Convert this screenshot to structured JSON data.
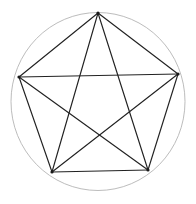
{
  "figure": {
    "canvas": {
      "width": 196,
      "height": 204,
      "background": "#ffffff"
    },
    "circle": {
      "name": "circumscribed-circle",
      "cx": 98,
      "cy": 101.5,
      "rx": 87,
      "ry": 89,
      "stroke": "#b4b4b4",
      "stroke_width": 0.9
    },
    "vertices": [
      {
        "id": "top",
        "label": "A",
        "x": 98,
        "y": 13
      },
      {
        "id": "right",
        "label": "B",
        "x": 178,
        "y": 74
      },
      {
        "id": "bottom-right",
        "label": "C",
        "x": 148,
        "y": 170
      },
      {
        "id": "bottom-left",
        "label": "D",
        "x": 52,
        "y": 172
      },
      {
        "id": "left",
        "label": "E",
        "x": 19,
        "y": 77
      }
    ],
    "vertex_style": {
      "fill": "#1a1a1a",
      "radius": 1.6
    },
    "edge_style": {
      "stroke": "#222222",
      "stroke_width": 1.15
    },
    "edges": [
      {
        "id": "edge-top-right",
        "kind": "pentagon-side",
        "from": "top",
        "to": "right"
      },
      {
        "id": "edge-right-bottomright",
        "kind": "pentagon-side",
        "from": "right",
        "to": "bottom-right"
      },
      {
        "id": "edge-bottomright-bottomleft",
        "kind": "pentagon-side",
        "from": "bottom-right",
        "to": "bottom-left"
      },
      {
        "id": "edge-bottomleft-left",
        "kind": "pentagon-side",
        "from": "bottom-left",
        "to": "left"
      },
      {
        "id": "edge-left-top",
        "kind": "pentagon-side",
        "from": "left",
        "to": "top"
      },
      {
        "id": "edge-top-bottomright",
        "kind": "pentagram-chord",
        "from": "top",
        "to": "bottom-right"
      },
      {
        "id": "edge-top-bottomleft",
        "kind": "pentagram-chord",
        "from": "top",
        "to": "bottom-left"
      },
      {
        "id": "edge-right-bottomleft",
        "kind": "pentagram-chord",
        "from": "right",
        "to": "bottom-left"
      },
      {
        "id": "edge-right-left",
        "kind": "pentagram-chord",
        "from": "right",
        "to": "left"
      },
      {
        "id": "edge-bottomright-left",
        "kind": "pentagram-chord",
        "from": "bottom-right",
        "to": "left"
      }
    ]
  }
}
